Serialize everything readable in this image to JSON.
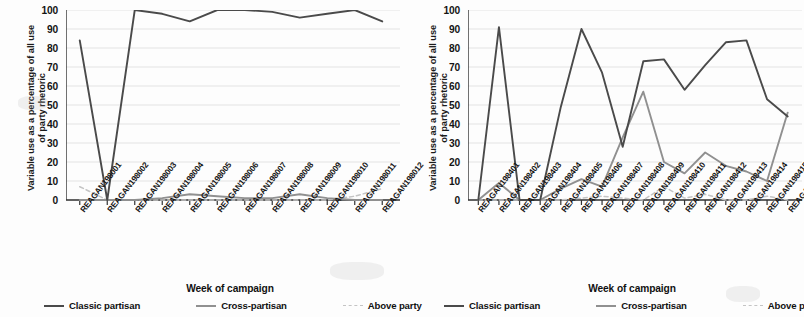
{
  "figure": {
    "background": "#fdfdfd",
    "axis_title_y": [
      "Variable use as a percentage of all use",
      "of party rhetoric"
    ],
    "axis_title_x": "Week of campaign"
  },
  "legend": {
    "items": [
      {
        "label": "Classic partisan",
        "color": "#4a4a4a",
        "style": "solid"
      },
      {
        "label": "Cross-partisan",
        "color": "#909090",
        "style": "solid"
      },
      {
        "label": "Above party",
        "color": "#c4c4c4",
        "style": "dashed"
      }
    ]
  },
  "chart_data": [
    {
      "id": "reagan-1980",
      "type": "line",
      "title": "",
      "xlabel": "Week of campaign",
      "ylabel": "Variable use as a percentage of all use of party rhetoric",
      "ylim": [
        0,
        100
      ],
      "yticks": [
        0,
        10,
        20,
        30,
        40,
        50,
        60,
        70,
        80,
        90,
        100
      ],
      "grid": true,
      "legend_position": "bottom",
      "categories": [
        "REAGAN198001",
        "REAGAN198002",
        "REAGAN198003",
        "REAGAN198004",
        "REAGAN198005",
        "REAGAN198006",
        "REAGAN198007",
        "REAGAN198008",
        "REAGAN198009",
        "REAGAN198010",
        "REAGAN198011",
        "REAGAN198012"
      ],
      "series": [
        {
          "name": "Classic partisan",
          "color": "#4a4a4a",
          "style": "solid",
          "values": [
            84,
            0,
            100,
            98,
            94,
            100,
            100,
            99,
            96,
            98,
            100,
            94
          ]
        },
        {
          "name": "Cross-partisan",
          "color": "#909090",
          "style": "solid",
          "values": [
            0,
            0,
            0,
            1,
            3,
            2,
            1,
            1,
            3,
            1,
            0,
            0
          ]
        },
        {
          "name": "Above party",
          "color": "#c4c4c4",
          "style": "dashed",
          "values": [
            7,
            0,
            0,
            0,
            0,
            0,
            0,
            0,
            0,
            0,
            2,
            6
          ]
        }
      ]
    },
    {
      "id": "reagan-1984",
      "type": "line",
      "title": "",
      "xlabel": "Week of campaign",
      "ylabel": "Variable use as a percentage of all use of party rhetoric",
      "ylim": [
        0,
        100
      ],
      "yticks": [
        0,
        10,
        20,
        30,
        40,
        50,
        60,
        70,
        80,
        90,
        100
      ],
      "grid": true,
      "legend_position": "bottom",
      "categories": [
        "REAGAN198401",
        "REAGAN198402",
        "REAGAN198403",
        "REAGAN198404",
        "REAGAN198405",
        "REAGAN198406",
        "REAGAN198407",
        "REAGAN198408",
        "REAGAN198409",
        "REAGAN198410",
        "REAGAN198411",
        "REAGAN198412",
        "REAGAN198413",
        "REAGAN198414",
        "REAGAN198415",
        "REAGAN198416"
      ],
      "series": [
        {
          "name": "Classic partisan",
          "color": "#4a4a4a",
          "style": "solid",
          "values": [
            0,
            91,
            0,
            0,
            49,
            90,
            67,
            28,
            73,
            74,
            58,
            71,
            83,
            84,
            53,
            44
          ]
        },
        {
          "name": "Cross-partisan",
          "color": "#909090",
          "style": "solid",
          "values": [
            0,
            9,
            0,
            0,
            6,
            11,
            7,
            33,
            57,
            20,
            14,
            25,
            18,
            15,
            10,
            46
          ]
        },
        {
          "name": "Above party",
          "color": "#c4c4c4",
          "style": "dashed",
          "values": [
            0,
            0,
            0,
            0,
            0,
            1,
            2,
            1,
            0,
            7,
            1,
            3,
            0,
            0,
            2,
            0
          ]
        }
      ]
    }
  ]
}
